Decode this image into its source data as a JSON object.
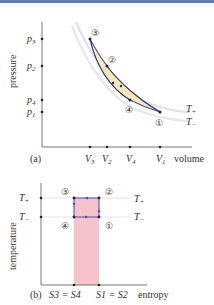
{
  "panel_a": {
    "label": "(a)",
    "ylabel": "pressure",
    "xlabel": "volume",
    "y_ticks": [
      {
        "label": "p3",
        "main": "p",
        "sub": "3",
        "y": 39
      },
      {
        "label": "p2",
        "main": "p",
        "sub": "2",
        "y": 66
      },
      {
        "label": "p4",
        "main": "p",
        "sub": "4",
        "y": 100
      },
      {
        "label": "p1",
        "main": "p",
        "sub": "1",
        "y": 112
      }
    ],
    "x_ticks": [
      {
        "label": "V3",
        "main": "V",
        "sub": "3",
        "x": 90
      },
      {
        "label": "V2",
        "main": "V",
        "sub": "2",
        "x": 107
      },
      {
        "label": "V4",
        "main": "V",
        "sub": "4",
        "x": 130
      },
      {
        "label": "V1",
        "main": "V",
        "sub": "1",
        "x": 160
      }
    ],
    "points": [
      {
        "id": "1",
        "glyph": "①",
        "x": 160,
        "y": 112
      },
      {
        "id": "2",
        "glyph": "②",
        "x": 107,
        "y": 66
      },
      {
        "id": "3",
        "glyph": "③",
        "x": 90,
        "y": 39
      },
      {
        "id": "4",
        "glyph": "④",
        "x": 130,
        "y": 100
      }
    ],
    "isotherms": [
      {
        "label": "T+",
        "main": "T",
        "sub": "+"
      },
      {
        "label": "T−",
        "main": "T",
        "sub": "−"
      }
    ]
  },
  "panel_b": {
    "label": "(b)",
    "ylabel": "temperature",
    "xlabel": "entropy",
    "y_ticks": [
      {
        "label": "T+",
        "main": "T",
        "sub": "+"
      },
      {
        "label": "T−",
        "main": "T",
        "sub": "−"
      }
    ],
    "x_ticks": [
      {
        "label": "S3 = S4"
      },
      {
        "label": "S1 = S2"
      }
    ],
    "points": [
      {
        "id": "1",
        "glyph": "①"
      },
      {
        "id": "2",
        "glyph": "②"
      },
      {
        "id": "3",
        "glyph": "③"
      },
      {
        "id": "4",
        "glyph": "④"
      }
    ]
  },
  "colors": {
    "cycle": "#4a4aa8",
    "isotherm": "#d8dce8",
    "inner_fill": "#f5e6a8",
    "entropy_fill": "#f4b8c4",
    "axis": "#555555"
  }
}
